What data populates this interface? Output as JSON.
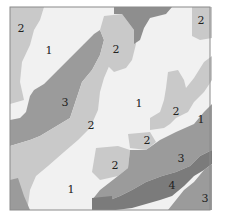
{
  "map": {
    "type": "categorical-region-map",
    "class_colors": {
      "1": "#f1f1f1",
      "2": "#c9c9c9",
      "3": "#9b9b9b",
      "4": "#7b7b7b"
    },
    "border_color": "#8a8a8a",
    "labels": [
      {
        "text": "2",
        "x": 21,
        "y": 28
      },
      {
        "text": "1",
        "x": 49,
        "y": 50
      },
      {
        "text": "2",
        "x": 116,
        "y": 49
      },
      {
        "text": "2",
        "x": 201,
        "y": 20
      },
      {
        "text": "3",
        "x": 65,
        "y": 102
      },
      {
        "text": "1",
        "x": 139,
        "y": 103
      },
      {
        "text": "2",
        "x": 176,
        "y": 111
      },
      {
        "text": "1",
        "x": 201,
        "y": 119
      },
      {
        "text": "2",
        "x": 91,
        "y": 125
      },
      {
        "text": "2",
        "x": 147,
        "y": 140
      },
      {
        "text": "3",
        "x": 181,
        "y": 158
      },
      {
        "text": "2",
        "x": 115,
        "y": 165
      },
      {
        "text": "4",
        "x": 172,
        "y": 185
      },
      {
        "text": "1",
        "x": 71,
        "y": 189
      },
      {
        "text": "3",
        "x": 205,
        "y": 198
      }
    ]
  }
}
